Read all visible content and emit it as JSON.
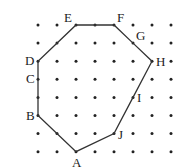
{
  "diagram": {
    "type": "lattice-polygon",
    "grid": {
      "cols": 8,
      "rows": 8,
      "x0": 38,
      "y0": 25,
      "dx": 19,
      "dy": 18.1,
      "dot_color": "#222222",
      "line_color": "#333333"
    },
    "points": [
      {
        "label": "E",
        "col": 2,
        "row": 0,
        "lx": -12,
        "ly": -3
      },
      {
        "label": "F",
        "col": 4,
        "row": 0,
        "lx": 3,
        "ly": -3
      },
      {
        "label": "G",
        "col": 5,
        "row": 1,
        "lx": 3,
        "ly": -3
      },
      {
        "label": "H",
        "col": 6,
        "row": 2,
        "lx": 4,
        "ly": 5
      },
      {
        "label": "I",
        "col": 5,
        "row": 4,
        "lx": 4,
        "ly": 5
      },
      {
        "label": "J",
        "col": 4,
        "row": 6,
        "lx": 4,
        "ly": 5
      },
      {
        "label": "A",
        "col": 2,
        "row": 7,
        "lx": -4,
        "ly": 15
      },
      {
        "label": "B",
        "col": 0,
        "row": 5,
        "lx": -12,
        "ly": 4
      },
      {
        "label": "C",
        "col": 0,
        "row": 3,
        "lx": -12,
        "ly": 4
      },
      {
        "label": "D",
        "col": 0,
        "row": 2,
        "lx": -13,
        "ly": 4
      }
    ],
    "polygon_order": [
      "E",
      "F",
      "G",
      "H",
      "I",
      "J",
      "A",
      "B",
      "C",
      "D"
    ]
  }
}
